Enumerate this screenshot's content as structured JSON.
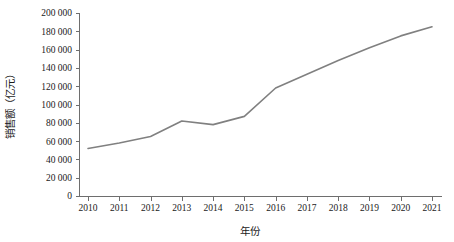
{
  "chart_data": {
    "type": "line",
    "title": "",
    "xlabel": "年份",
    "ylabel": "销售额（亿元）",
    "categories": [
      "2010",
      "2011",
      "2012",
      "2013",
      "2014",
      "2015",
      "2016",
      "2017",
      "2018",
      "2019",
      "2020",
      "2021"
    ],
    "x": [
      2010,
      2011,
      2012,
      2013,
      2014,
      2015,
      2016,
      2017,
      2018,
      2019,
      2020,
      2021
    ],
    "series": [
      {
        "name": "销售额",
        "values": [
          52000,
          58000,
          65000,
          82000,
          78000,
          87000,
          118000,
          133000,
          148000,
          162000,
          175000,
          185000
        ],
        "color": "#808080"
      }
    ],
    "ylim": [
      0,
      200000
    ],
    "ytick_values": [
      0,
      20000,
      40000,
      60000,
      80000,
      100000,
      120000,
      140000,
      160000,
      180000,
      200000
    ],
    "ytick_labels": [
      "0",
      "20 000",
      "40 000",
      "60 000",
      "80 000",
      "100 000",
      "120 000",
      "140 000",
      "160 000",
      "180 000",
      "200 000"
    ],
    "grid": false,
    "legend": false,
    "legend_position": "none",
    "axis_color": "#6e6e6e",
    "background_color": "#ffffff"
  }
}
